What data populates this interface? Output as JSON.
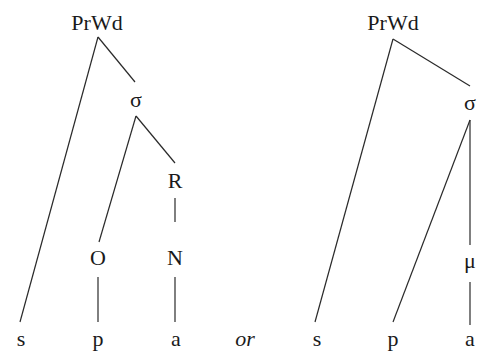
{
  "diagram": {
    "type": "prosodic-structure-trees",
    "separator": "or",
    "trees": [
      {
        "id": "left",
        "nodes": {
          "root": "PrWd",
          "syllable": "σ",
          "rhyme": "R",
          "onset": "O",
          "nucleus": "N",
          "seg1": "s",
          "seg2": "p",
          "seg3": "a"
        },
        "edges": [
          [
            "PrWd",
            "s"
          ],
          [
            "PrWd",
            "σ"
          ],
          [
            "σ",
            "O"
          ],
          [
            "σ",
            "R"
          ],
          [
            "R",
            "N"
          ],
          [
            "O",
            "p"
          ],
          [
            "N",
            "a"
          ]
        ]
      },
      {
        "id": "right",
        "nodes": {
          "root": "PrWd",
          "syllable": "σ",
          "mora": "μ",
          "seg1": "s",
          "seg2": "p",
          "seg3": "a"
        },
        "edges": [
          [
            "PrWd",
            "s"
          ],
          [
            "PrWd",
            "σ"
          ],
          [
            "σ",
            "p"
          ],
          [
            "σ",
            "μ"
          ],
          [
            "μ",
            "a"
          ]
        ]
      }
    ]
  }
}
